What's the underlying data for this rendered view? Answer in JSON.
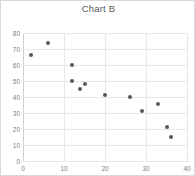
{
  "chart_data": {
    "type": "scatter",
    "title": "Chart B",
    "xlabel": "",
    "ylabel": "",
    "xlim": [
      0,
      40
    ],
    "ylim": [
      0,
      80
    ],
    "xticks": [
      0,
      10,
      20,
      30,
      40
    ],
    "yticks": [
      0,
      10,
      20,
      30,
      40,
      50,
      60,
      70,
      80
    ],
    "grid": true,
    "legend": "none",
    "marker_color": "#595959",
    "series": [
      {
        "name": "Series 1",
        "points": [
          {
            "x": 2,
            "y": 66
          },
          {
            "x": 6,
            "y": 74
          },
          {
            "x": 12,
            "y": 60
          },
          {
            "x": 12,
            "y": 50
          },
          {
            "x": 14,
            "y": 45
          },
          {
            "x": 15,
            "y": 48
          },
          {
            "x": 20,
            "y": 41.5
          },
          {
            "x": 26,
            "y": 40
          },
          {
            "x": 29,
            "y": 31.5
          },
          {
            "x": 33,
            "y": 35.5
          },
          {
            "x": 35,
            "y": 21
          },
          {
            "x": 36,
            "y": 15
          }
        ]
      }
    ]
  }
}
